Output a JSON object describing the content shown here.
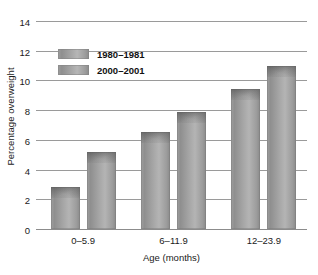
{
  "chart_data": {
    "type": "bar",
    "title": "",
    "xlabel": "Age (months)",
    "ylabel": "Percentage overweight",
    "categories": [
      "0–5.9",
      "6–11.9",
      "12–23.9"
    ],
    "series": [
      {
        "name": "1980–1981",
        "values": [
          2.8,
          6.5,
          9.4
        ]
      },
      {
        "name": "2000–2001",
        "values": [
          5.2,
          7.9,
          11.0
        ]
      }
    ],
    "ylim": [
      0,
      14
    ],
    "yticks": [
      0,
      2,
      4,
      6,
      8,
      10,
      12,
      14
    ],
    "ytick_labels": [
      "0",
      "2",
      "4",
      "6",
      "8",
      "10",
      "12",
      "14"
    ],
    "grid": true,
    "legend_position": "top-left-inside",
    "bar_color": "#a2a2a2",
    "grid_color": "#9a9a9a",
    "text_color": "#1a1a1a"
  }
}
